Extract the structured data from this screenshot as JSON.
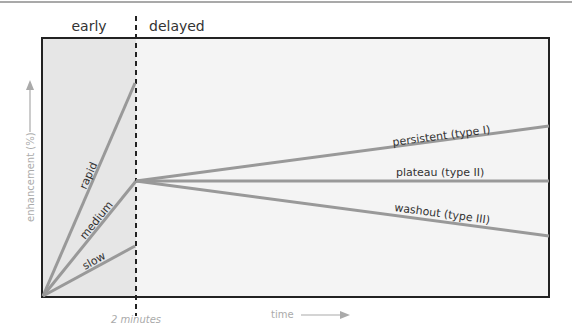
{
  "diagram": {
    "phases": {
      "early": "early",
      "delayed": "delayed"
    },
    "axes": {
      "y_label": "enhancement (%)",
      "x_label": "time",
      "x_marker": "2 minutes"
    },
    "uptake_curves": [
      {
        "label": "rapid"
      },
      {
        "label": "medium"
      },
      {
        "label": "slow"
      }
    ],
    "delayed_curves": [
      {
        "label": "persistent (type I)"
      },
      {
        "label": "plateau (type II)"
      },
      {
        "label": "washout (type III)"
      }
    ],
    "colors": {
      "line": "#999999",
      "early_bg": "#e6e6e6",
      "delayed_bg": "#f3f3f3",
      "frame": "#222222"
    }
  }
}
